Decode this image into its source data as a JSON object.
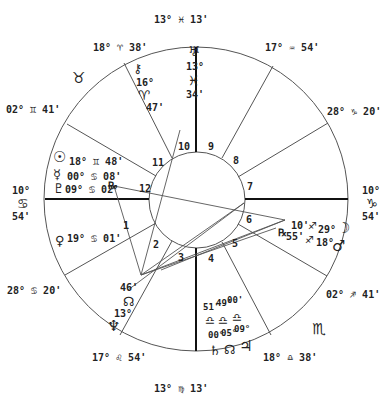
{
  "chart": {
    "type": "natal-wheel",
    "cusps": {
      "mc": "13° ♓ 13'",
      "ic": "13° ♍ 13'",
      "asc": {
        "deg": "10°",
        "sign": "♋",
        "min": "54'"
      },
      "dsc": {
        "deg": "10°",
        "sign": "♑",
        "min": "54'"
      },
      "c11": "18° ♈ 38'",
      "c12": "02° ♊ 41'",
      "c8": "17° ♒ 54'",
      "c7": "28° ♑ 20'",
      "c2": "28° ♋ 20'",
      "c3": "17° ♌ 54'",
      "c5": "02° ♐ 41'",
      "c4": "18° ♎ 38'"
    },
    "intercepted_signs": {
      "taurus": "♉",
      "scorpio": "♏"
    },
    "houses": [
      "1",
      "2",
      "3",
      "4",
      "5",
      "6",
      "7",
      "8",
      "9",
      "10",
      "11",
      "12"
    ],
    "planets": {
      "uranus": {
        "glyph": "♅",
        "deg": "13°",
        "sign": "♓",
        "min": "34'"
      },
      "chiron": {
        "glyph": "⚷",
        "deg": "16°",
        "sign": "♈",
        "min": "47'"
      },
      "sun": {
        "glyph": "☉",
        "text": "18° ♊ 48'"
      },
      "mercury": {
        "glyph": "☿",
        "text": "00° ♋ 08'"
      },
      "pluto": {
        "glyph": "♇",
        "text": "09° ♋ 02'"
      },
      "retro_left": "℞",
      "venus": {
        "glyph": "♀",
        "text": "19° ♋ 01'"
      },
      "node_north": {
        "glyph": "☊",
        "deg": "13°",
        "min": "46'"
      },
      "neptune": {
        "glyph": "♆"
      },
      "saturn": {
        "glyph": "♄",
        "deg": "00°",
        "min": "51'",
        "sign": "♎"
      },
      "node_south": {
        "glyph": "☊",
        "deg": "05°",
        "min": "49'",
        "sign": "♎"
      },
      "jupiter": {
        "glyph": "♃",
        "deg": "09°",
        "min": "00'",
        "sign": "♎"
      },
      "retro_right": "℞",
      "moon_side": {
        "deg1": "10'",
        "sign1": "♐",
        "deg2": "55'",
        "sign2": "♐"
      },
      "moon": {
        "glyph": "☽",
        "deg": "29°"
      },
      "mars": {
        "glyph": "♂",
        "deg": "18°"
      }
    }
  }
}
